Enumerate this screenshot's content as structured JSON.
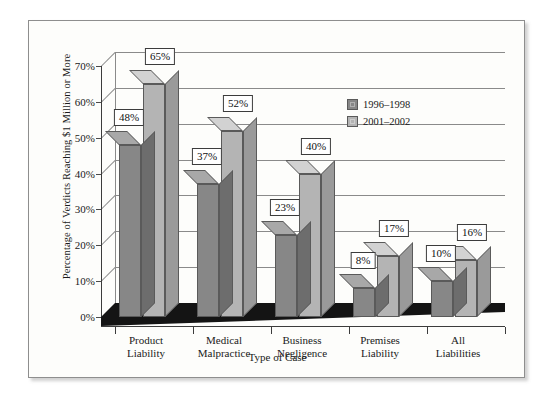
{
  "chart_data": {
    "type": "bar",
    "title": "",
    "subtitle": "",
    "xlabel": "Type of Case",
    "ylabel": "Percentage of Verdicts Reaching $1 Million or More",
    "categories": [
      "Product\nLiability",
      "Medical\nMalpractice",
      "Business\nNegligence",
      "Premises\nLiability",
      "All\nLiabilities"
    ],
    "category_lines": [
      [
        "Product",
        "Liability"
      ],
      [
        "Medical",
        "Malpractice"
      ],
      [
        "Business",
        "Negligence"
      ],
      [
        "Premises",
        "Liability"
      ],
      [
        "All",
        "Liabilities"
      ]
    ],
    "series": [
      {
        "name": "1996–1998",
        "color": "#878787",
        "values": [
          48,
          37,
          23,
          8,
          10
        ],
        "labels": [
          "48%",
          "37%",
          "23%",
          "8%",
          "10%"
        ]
      },
      {
        "name": "2001–2002",
        "color": "#b4b4b4",
        "values": [
          65,
          52,
          40,
          17,
          16
        ],
        "labels": [
          "65%",
          "52%",
          "40%",
          "17%",
          "16%"
        ]
      }
    ],
    "ylim": [
      0,
      70
    ],
    "yticks": [
      0,
      10,
      20,
      30,
      40,
      50,
      60,
      70
    ],
    "ytick_labels": [
      "0%",
      "10%",
      "20%",
      "30%",
      "40%",
      "50%",
      "60%",
      "70%"
    ],
    "grid": true,
    "legend_position": "inside-upper-right",
    "style": "3d-column",
    "data_labels_shown": true
  },
  "legend": {
    "entries": [
      {
        "label": "1996–1998",
        "color": "#878787"
      },
      {
        "label": "2001–2002",
        "color": "#b4b4b4"
      }
    ]
  },
  "colors": {
    "series1": "#878787",
    "series1_top": "#a8a8a8",
    "series1_side": "#6d6d6d",
    "series2": "#b4b4b4",
    "series2_top": "#d2d2d2",
    "series2_side": "#9a9a9a",
    "grid": "#8a8a8a",
    "axis": "#3c3c3c",
    "floor": "#141414",
    "frame": "#8e8e8e",
    "plot_background": "#fdfdfb",
    "page_background": "#ffffff",
    "label_box_fill": "#ffffff",
    "label_box_border": "#3c3c3c",
    "text": "#1a1a1a"
  }
}
